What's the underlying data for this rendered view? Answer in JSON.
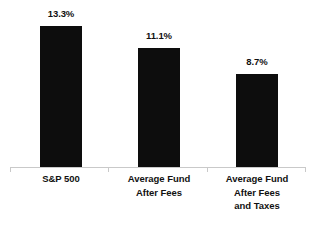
{
  "chart_data": {
    "type": "bar",
    "title": "",
    "subtitle": "",
    "xlabel": "",
    "ylabel": "",
    "categories": [
      "S&P 500",
      "Average Fund After Fees",
      "Average Fund After Fees and Taxes"
    ],
    "category_lines": [
      [
        "S&P 500"
      ],
      [
        "Average Fund",
        "After Fees"
      ],
      [
        "Average Fund",
        "After Fees",
        "and Taxes"
      ]
    ],
    "values": [
      13.3,
      11.1,
      8.7
    ],
    "value_labels": [
      "13.3%",
      "11.1%",
      "8.7%"
    ],
    "ylim": [
      0,
      15.7
    ],
    "grid": false,
    "legend": false,
    "bar_color": "#0d0d0d",
    "axis_color": "#c9c9c9",
    "background_color": "#ffffff",
    "text_color": "#111111",
    "units": "percent"
  },
  "bars": [
    {
      "label": "S&P 500",
      "value_label": "13.3%",
      "left_px": 40,
      "width_px": 42,
      "height_px": 142,
      "label_top_px": 8
    },
    {
      "label": "Average Fund After Fees",
      "value_label": "11.1%",
      "left_px": 138,
      "width_px": 42,
      "height_px": 120,
      "label_top_px": 30
    },
    {
      "label": "Average Fund After Fees and Taxes",
      "value_label": "8.7%",
      "left_px": 236,
      "width_px": 42,
      "height_px": 94,
      "label_top_px": 56
    }
  ]
}
